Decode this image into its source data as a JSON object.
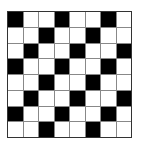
{
  "grid": {
    "rows": 8,
    "cols": 8,
    "colors": {
      "filled": "#000000",
      "empty": "#ffffff",
      "line": "#888888"
    },
    "cells": [
      [
        1,
        0,
        0,
        1,
        0,
        0,
        1,
        0
      ],
      [
        0,
        0,
        1,
        0,
        0,
        1,
        0,
        0
      ],
      [
        0,
        1,
        0,
        0,
        1,
        0,
        0,
        1
      ],
      [
        1,
        0,
        0,
        1,
        0,
        0,
        1,
        0
      ],
      [
        0,
        0,
        1,
        0,
        0,
        1,
        0,
        0
      ],
      [
        0,
        1,
        0,
        0,
        1,
        0,
        0,
        1
      ],
      [
        1,
        0,
        0,
        1,
        0,
        0,
        1,
        0
      ],
      [
        0,
        0,
        1,
        0,
        0,
        1,
        0,
        0
      ]
    ]
  }
}
